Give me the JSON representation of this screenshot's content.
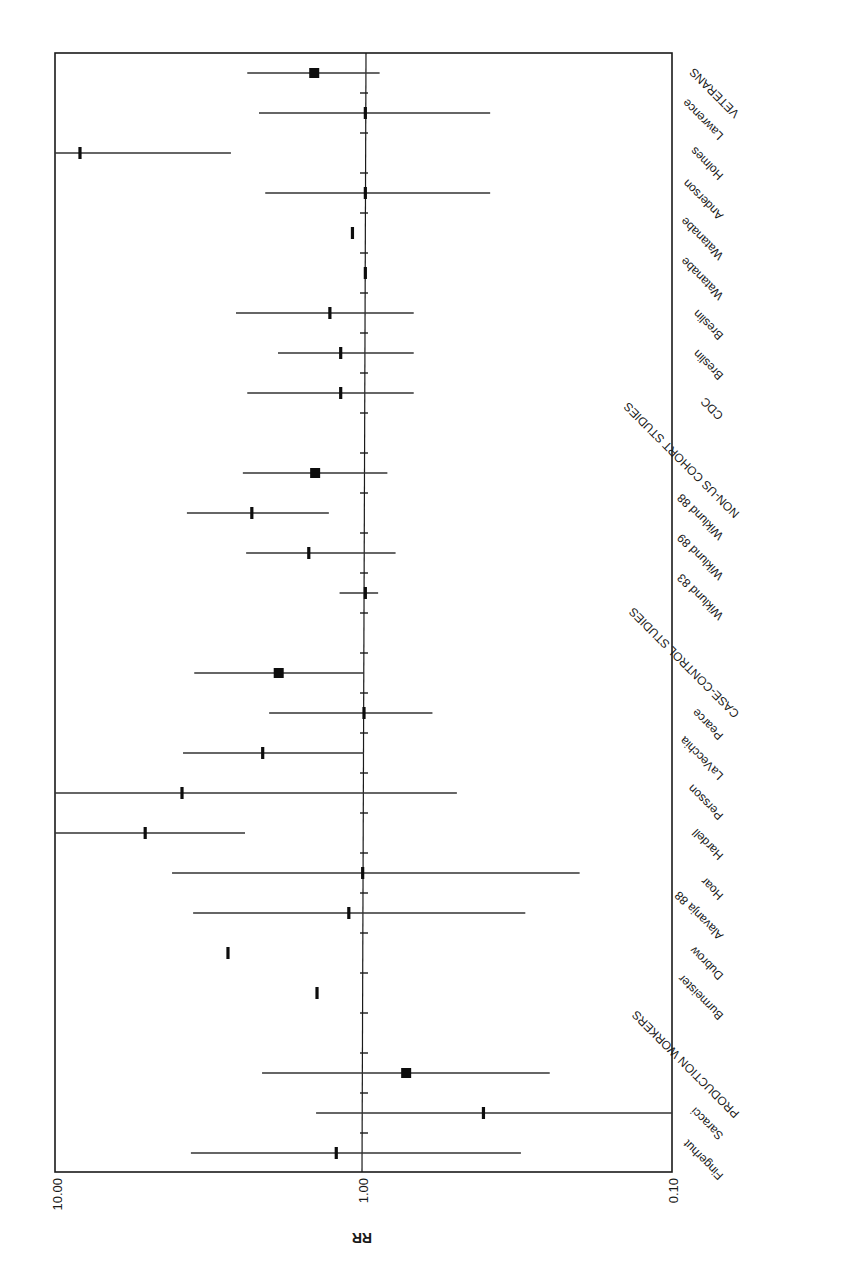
{
  "chart_data": {
    "type": "forest",
    "orientation_note": "figure rendered rotated 180 degrees",
    "title": "",
    "xlabel": "RR",
    "ylabel": "",
    "x_scale": "log",
    "xlim": [
      10.0,
      0.1
    ],
    "x_ticks": [
      "10.00",
      "1.00",
      "0.10"
    ],
    "reference_line": 1.0,
    "grid": false,
    "legend": null,
    "rows": [
      {
        "label": "VETERANS",
        "kind": "summary",
        "rr": 1.45,
        "lo": 0.89,
        "hi": 2.39
      },
      {
        "label": "Lawrence",
        "kind": "study",
        "rr": 0.99,
        "lo": 0.39,
        "hi": 2.19
      },
      {
        "label": "Holmes",
        "kind": "study",
        "rr": 8.33,
        "lo": 2.7,
        "hi": 10.3
      },
      {
        "label": "Anderson",
        "kind": "study",
        "rr": 0.99,
        "lo": 0.39,
        "hi": 2.09
      },
      {
        "label": "Watanabe",
        "kind": "study",
        "rr": 1.09,
        "lo": null,
        "hi": null
      },
      {
        "label": "Watanabe",
        "kind": "study",
        "rr": 0.99,
        "lo": null,
        "hi": null
      },
      {
        "label": "Breslin",
        "kind": "study",
        "rr": 1.29,
        "lo": 0.69,
        "hi": 2.6
      },
      {
        "label": "Breslin",
        "kind": "study",
        "rr": 1.19,
        "lo": 0.69,
        "hi": 1.9
      },
      {
        "label": "CDC",
        "kind": "study",
        "rr": 1.19,
        "lo": 0.69,
        "hi": 2.39
      },
      {
        "label": "",
        "kind": "blank"
      },
      {
        "label": "NON-US COHORT STUDIES",
        "kind": "summary",
        "rr": 1.44,
        "lo": 0.84,
        "hi": 2.47
      },
      {
        "label": "Wiklund 88",
        "kind": "study",
        "rr": 2.31,
        "lo": 1.3,
        "hi": 3.75
      },
      {
        "label": "Wiklund 89",
        "kind": "study",
        "rr": 1.51,
        "lo": 0.79,
        "hi": 2.41
      },
      {
        "label": "Wiklund 83",
        "kind": "study",
        "rr": 0.99,
        "lo": 0.9,
        "hi": 1.2
      },
      {
        "label": "",
        "kind": "blank"
      },
      {
        "label": "CASE-CONTROL STUDIES",
        "kind": "summary",
        "rr": 1.89,
        "lo": 1.0,
        "hi": 3.55
      },
      {
        "label": "Pearce",
        "kind": "study",
        "rr": 1.0,
        "lo": 0.6,
        "hi": 2.03
      },
      {
        "label": "LaVecchia",
        "kind": "study",
        "rr": 2.13,
        "lo": 1.0,
        "hi": 3.86
      },
      {
        "label": "Persson",
        "kind": "study",
        "rr": 3.89,
        "lo": 0.5,
        "hi": 10.5
      },
      {
        "label": "Hardell",
        "kind": "study",
        "rr": 5.12,
        "lo": 2.43,
        "hi": 10.4
      },
      {
        "label": "Hoar",
        "kind": "study",
        "rr": 1.01,
        "lo": 0.2,
        "hi": 4.19
      },
      {
        "label": "Alavanja 88",
        "kind": "study",
        "rr": 1.12,
        "lo": 0.3,
        "hi": 3.58
      },
      {
        "label": "Dubrow",
        "kind": "study",
        "rr": 2.76,
        "lo": null,
        "hi": null
      },
      {
        "label": "Burmeister",
        "kind": "study",
        "rr": 1.42,
        "lo": null,
        "hi": null
      },
      {
        "label": "",
        "kind": "blank"
      },
      {
        "label": "PRODUCTION WORKERS",
        "kind": "summary",
        "rr": 0.73,
        "lo": 0.25,
        "hi": 2.14
      },
      {
        "label": "Saracci",
        "kind": "study",
        "rr": 0.41,
        "lo": 0.1,
        "hi": 1.43
      },
      {
        "label": "Fingerhut",
        "kind": "study",
        "rr": 1.23,
        "lo": 0.31,
        "hi": 3.64
      }
    ]
  },
  "axis": {
    "tick_10": "10.00",
    "tick_1": "1.00",
    "tick_01": "0.10",
    "title": "RR"
  },
  "colors": {
    "ink": "#1a1a1a",
    "background": "#ffffff"
  }
}
